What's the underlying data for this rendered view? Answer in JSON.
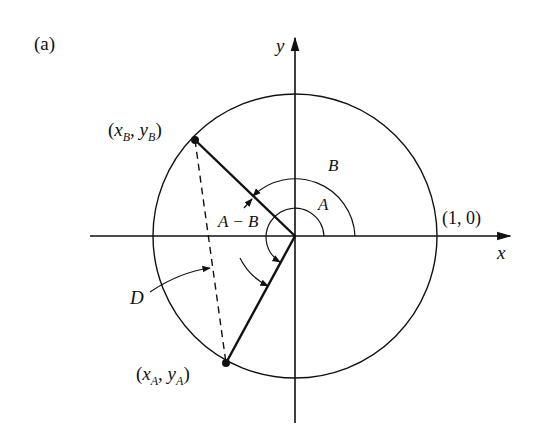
{
  "figure": {
    "panel_label": "(a)",
    "axes": {
      "x_label": "x",
      "y_label": "y"
    },
    "unit_circle": {
      "center": [
        295,
        236
      ],
      "radius": 142
    },
    "points": {
      "A": {
        "label_var": "x",
        "label_sub": "A",
        "label_var2": "y",
        "label_sub2": "A",
        "pos": [
          226,
          363
        ]
      },
      "B": {
        "label_var": "x",
        "label_sub": "B",
        "label_var2": "y",
        "label_sub2": "B",
        "pos": [
          195,
          140
        ]
      }
    },
    "reference_point_label": "(1, 0)",
    "angle_labels": {
      "A": "A",
      "B": "B",
      "A_minus_B": "A − B"
    },
    "distance_label": "D",
    "punct": {
      "open": "(",
      "comma": ", ",
      "close": ")"
    },
    "colors": {
      "ink": "#111111",
      "background": "#ffffff"
    }
  }
}
